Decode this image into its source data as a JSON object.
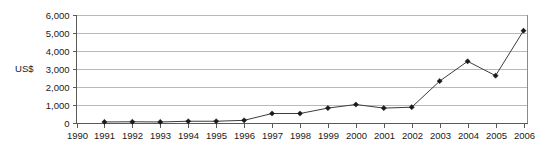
{
  "chart_data": {
    "type": "line",
    "title": "",
    "subtitle": "",
    "xlabel": "",
    "ylabel": "US$",
    "categories": [
      "1990",
      "1991",
      "1992",
      "1993",
      "1994",
      "1995",
      "1996",
      "1997",
      "1998",
      "1999",
      "2000",
      "2001",
      "2002",
      "2003",
      "2004",
      "2005",
      "2006"
    ],
    "x": [
      1990,
      1991,
      1992,
      1993,
      1994,
      1995,
      1996,
      1997,
      1998,
      1999,
      2000,
      2001,
      2002,
      2003,
      2004,
      2005,
      2006
    ],
    "values": [
      null,
      30,
      40,
      30,
      70,
      70,
      120,
      500,
      500,
      800,
      1000,
      800,
      850,
      2300,
      3400,
      2600,
      5100
    ],
    "series": [
      {
        "name": "US$",
        "values": [
          null,
          30,
          40,
          30,
          70,
          70,
          120,
          500,
          500,
          800,
          1000,
          800,
          850,
          2300,
          3400,
          2600,
          5100
        ]
      }
    ],
    "ylim": [
      0,
      6000
    ],
    "xlim": [
      1990,
      2006
    ],
    "y_ticks": [
      0,
      1000,
      2000,
      3000,
      4000,
      5000,
      6000
    ],
    "y_tick_labels": [
      "0",
      "1,000",
      "2,000",
      "3,000",
      "4,000",
      "5,000",
      "6,000"
    ],
    "x_tick_labels": [
      "1990",
      "1991",
      "1992",
      "1993",
      "1994",
      "1995",
      "1996",
      "1997",
      "1998",
      "1999",
      "2000",
      "2001",
      "2002",
      "2003",
      "2004",
      "2005",
      "2006"
    ],
    "grid": true,
    "grid_axis": "y",
    "legend": false,
    "legend_position": "none",
    "marker": "diamond",
    "annotations": [],
    "colors": {
      "line": "#3d3d3d",
      "marker": "#1a1a1a",
      "gridline": "#b9b9b9",
      "axis": "#5a5a5a",
      "background": "#ffffff",
      "text": "#1a1a1a"
    }
  }
}
